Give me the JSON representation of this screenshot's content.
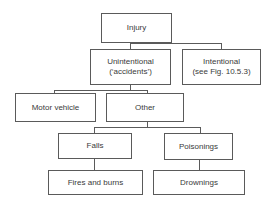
{
  "diagram": {
    "type": "tree",
    "nodes": {
      "injury": {
        "label": "Injury"
      },
      "unintentional": {
        "line1": "Unintentional",
        "line2": "(‘accidents’)"
      },
      "intentional": {
        "line1": "Intentional",
        "line2": "(see Fig. 10.5.3)"
      },
      "motor_vehicle": {
        "label": "Motor vehicle"
      },
      "other": {
        "label": "Other"
      },
      "falls": {
        "label": "Falls"
      },
      "poisonings": {
        "label": "Poisonings"
      },
      "fires_burns": {
        "label": "Fires and burns"
      },
      "drownings": {
        "label": "Drownings"
      }
    },
    "edges": [
      [
        "Injury",
        "Unintentional ('accidents')"
      ],
      [
        "Injury",
        "Intentional (see Fig. 10.5.3)"
      ],
      [
        "Unintentional ('accidents')",
        "Motor vehicle"
      ],
      [
        "Unintentional ('accidents')",
        "Other"
      ],
      [
        "Other",
        "Falls"
      ],
      [
        "Other",
        "Poisonings"
      ],
      [
        "Falls",
        "Fires and burns"
      ],
      [
        "Poisonings",
        "Drownings"
      ]
    ],
    "colors": {
      "line": "#5a5a5a",
      "text": "#3a3a3a",
      "background": "#ffffff"
    }
  }
}
